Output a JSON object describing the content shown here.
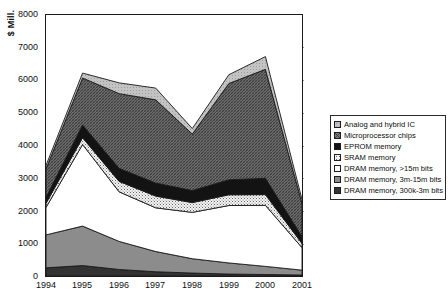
{
  "chart_data": {
    "type": "area",
    "stacked": true,
    "title": "",
    "xlabel": "",
    "ylabel": "$ Mill.",
    "categories": [
      "1994",
      "1995",
      "1996",
      "1997",
      "1998",
      "1999",
      "2000",
      "2001"
    ],
    "x": [
      1994,
      1995,
      1996,
      1997,
      1998,
      1999,
      2000,
      2001
    ],
    "ylim": [
      0,
      8000
    ],
    "ytick_labels": [
      "0",
      "1000",
      "2000",
      "3000",
      "4000",
      "5000",
      "6000",
      "7000",
      "8000"
    ],
    "ytick_values": [
      0,
      1000,
      2000,
      3000,
      4000,
      5000,
      6000,
      7000,
      8000
    ],
    "grid": true,
    "grid_style": "dotted-horizontal",
    "legend_position": "right",
    "series": [
      {
        "name": "DRAM memory, 300k-3m bits",
        "order": 1,
        "fill": "#2b2b2b",
        "pattern": "solid-dark",
        "values": [
          250,
          320,
          200,
          130,
          90,
          60,
          45,
          30
        ]
      },
      {
        "name": "DRAM memory, 3m-15m bits",
        "order": 2,
        "fill": "#8a8a8a",
        "pattern": "solid-mid-gray",
        "values": [
          1010,
          1210,
          860,
          620,
          440,
          340,
          250,
          150
        ]
      },
      {
        "name": "DRAM memory, >15m bits",
        "order": 3,
        "fill": "#ffffff",
        "pattern": "solid-white",
        "values": [
          840,
          2500,
          1520,
          1340,
          1420,
          1760,
          1870,
          690
        ]
      },
      {
        "name": "SRAM memory",
        "order": 4,
        "fill": "#e8e8e8",
        "pattern": "fine-dotted",
        "values": [
          130,
          210,
          320,
          360,
          300,
          330,
          330,
          130
        ]
      },
      {
        "name": "EPROM memory",
        "order": 5,
        "fill": "#181818",
        "pattern": "solid-black",
        "values": [
          180,
          390,
          400,
          400,
          370,
          460,
          500,
          210
        ]
      },
      {
        "name": "Microprocessor chips",
        "order": 6,
        "fill": "#6d6d6d",
        "pattern": "dense-crosshatch",
        "values": [
          870,
          1440,
          2290,
          2550,
          1730,
          2950,
          3340,
          1010
        ]
      },
      {
        "name": "Analog and hybrid IC",
        "order": 7,
        "fill": "#b8b8b8",
        "pattern": "light-gray",
        "values": [
          110,
          150,
          330,
          360,
          170,
          270,
          390,
          130
        ]
      }
    ],
    "stack_totals": [
      3390,
      6220,
      5920,
      5760,
      4520,
      6170,
      6725,
      2350
    ]
  },
  "legend": {
    "items": [
      {
        "label": "Analog and hybrid IC",
        "swatch": "light-gray"
      },
      {
        "label": "Microprocessor chips",
        "swatch": "dense-crosshatch"
      },
      {
        "label": "EPROM memory",
        "swatch": "solid-black"
      },
      {
        "label": "SRAM memory",
        "swatch": "fine-dotted"
      },
      {
        "label": "DRAM memory, >15m bits",
        "swatch": "solid-white"
      },
      {
        "label": "DRAM memory, 3m-15m bits",
        "swatch": "solid-mid-gray"
      },
      {
        "label": "DRAM memory, 300k-3m bits",
        "swatch": "solid-dark"
      }
    ]
  }
}
